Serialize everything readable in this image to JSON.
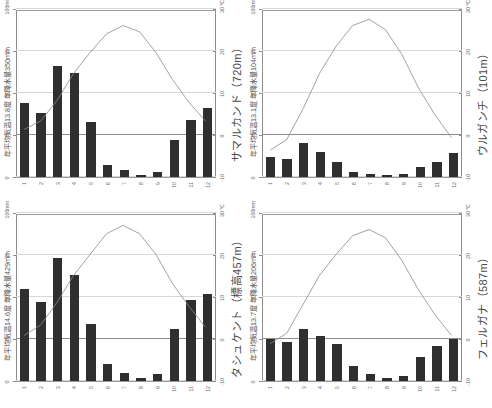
{
  "axes": {
    "precip_unit": "mm",
    "temp_unit": "℃",
    "precip_ticks": [
      0,
      25,
      50,
      75,
      100
    ],
    "temp_ticks": [
      -10,
      0,
      10,
      20,
      30
    ],
    "months": [
      "1",
      "2",
      "3",
      "4",
      "5",
      "6",
      "7",
      "8",
      "9",
      "10",
      "11",
      "12"
    ],
    "precip_range": [
      0,
      100
    ],
    "temp_range": [
      -10,
      30
    ]
  },
  "colors": {
    "bar": "#2f2f2f",
    "line": "#8a8a8a",
    "axis": "#8d8d8d",
    "grid": "#d8d8d8",
    "text": "#5a5a5a"
  },
  "chart_data": [
    {
      "id": "samarkand",
      "type": "bar",
      "title": "サマルカンド（720m）",
      "subtitle": "年平均気温13.8度 年降水量350mm",
      "station": "サマルカンド",
      "elevation_label": "720m",
      "mean_temp_label": "13.8度",
      "annual_precip_label": "350mm",
      "categories": [
        "1",
        "2",
        "3",
        "4",
        "5",
        "6",
        "7",
        "8",
        "9",
        "10",
        "11",
        "12"
      ],
      "xlabel": "月",
      "ylabel": "降水量 (mm)",
      "y2label": "気温 (℃)",
      "ylim": [
        0,
        100
      ],
      "y2lim": [
        -10,
        30
      ],
      "series": [
        {
          "name": "降水量",
          "kind": "bar",
          "unit": "mm",
          "values": [
            44,
            38,
            66,
            62,
            33,
            7,
            4,
            1,
            3,
            22,
            34,
            41
          ]
        },
        {
          "name": "気温",
          "kind": "line",
          "unit": "℃",
          "values": [
            1.5,
            3.5,
            8.5,
            15.0,
            20.0,
            24.5,
            26.5,
            25.0,
            20.0,
            13.5,
            8.0,
            3.5
          ]
        }
      ]
    },
    {
      "id": "urgench",
      "type": "bar",
      "title": "ウルガンチ（101m）",
      "subtitle": "年平均気温13.1度 年降水量104mm",
      "station": "ウルガンチ",
      "elevation_label": "101m",
      "mean_temp_label": "13.1度",
      "annual_precip_label": "104mm",
      "categories": [
        "1",
        "2",
        "3",
        "4",
        "5",
        "6",
        "7",
        "8",
        "9",
        "10",
        "11",
        "12"
      ],
      "xlabel": "月",
      "ylabel": "降水量 (mm)",
      "y2label": "気温 (℃)",
      "ylim": [
        0,
        100
      ],
      "y2lim": [
        -10,
        30
      ],
      "series": [
        {
          "name": "降水量",
          "kind": "bar",
          "unit": "mm",
          "values": [
            12,
            11,
            20,
            15,
            9,
            3,
            2,
            1,
            2,
            6,
            9,
            14
          ]
        },
        {
          "name": "気温",
          "kind": "line",
          "unit": "℃",
          "values": [
            -3.5,
            -1.0,
            6.5,
            15.0,
            21.5,
            26.5,
            28.0,
            25.5,
            19.5,
            11.5,
            5.0,
            -0.5
          ]
        }
      ]
    },
    {
      "id": "tashkent",
      "type": "bar",
      "title": "タシュケント（標高457m）",
      "subtitle": "年平均気温14.6度 年降水量429mm",
      "station": "タシュケント",
      "elevation_label": "標高457m",
      "mean_temp_label": "14.6度",
      "annual_precip_label": "429mm",
      "categories": [
        "1",
        "2",
        "3",
        "4",
        "5",
        "6",
        "7",
        "8",
        "9",
        "10",
        "11",
        "12"
      ],
      "xlabel": "月",
      "ylabel": "降水量 (mm)",
      "y2label": "気温 (℃)",
      "ylim": [
        0,
        100
      ],
      "y2lim": [
        -10,
        30
      ],
      "series": [
        {
          "name": "降水量",
          "kind": "bar",
          "unit": "mm",
          "values": [
            55,
            47,
            73,
            63,
            34,
            10,
            5,
            2,
            4,
            31,
            48,
            52
          ]
        },
        {
          "name": "気温",
          "kind": "line",
          "unit": "℃",
          "values": [
            1.0,
            3.5,
            9.0,
            15.5,
            20.5,
            25.5,
            27.5,
            25.5,
            20.5,
            13.5,
            8.0,
            3.0
          ]
        }
      ]
    },
    {
      "id": "fergana",
      "type": "bar",
      "title": "フェルガナ（587m）",
      "subtitle": "年平均気温13.7度 年降水量206mm",
      "station": "フェルガナ",
      "elevation_label": "587m",
      "mean_temp_label": "13.7度",
      "annual_precip_label": "206mm",
      "categories": [
        "1",
        "2",
        "3",
        "4",
        "5",
        "6",
        "7",
        "8",
        "9",
        "10",
        "11",
        "12"
      ],
      "xlabel": "月",
      "ylabel": "降水量 (mm)",
      "y2label": "気温 (℃)",
      "ylim": [
        0,
        100
      ],
      "y2lim": [
        -10,
        30
      ],
      "series": [
        {
          "name": "降水量",
          "kind": "bar",
          "unit": "mm",
          "values": [
            25,
            23,
            31,
            27,
            22,
            9,
            4,
            2,
            3,
            14,
            21,
            25
          ]
        },
        {
          "name": "気温",
          "kind": "line",
          "unit": "℃",
          "values": [
            -1.0,
            1.5,
            8.5,
            15.5,
            20.5,
            25.0,
            26.5,
            24.5,
            19.0,
            12.0,
            6.0,
            1.0
          ]
        }
      ]
    }
  ]
}
